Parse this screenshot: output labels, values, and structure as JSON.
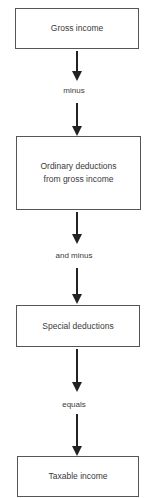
{
  "diagram": {
    "type": "flowchart",
    "direction": "top-to-bottom",
    "colors": {
      "background": "#ffffff",
      "box_border": "#555555",
      "arrow": "#222222",
      "text": "#3a3a3a"
    },
    "nodes": [
      {
        "id": "gross-income",
        "lines": [
          "Gross income"
        ]
      },
      {
        "id": "ordinary-deductions",
        "lines": [
          "Ordinary deductions",
          "from gross income"
        ]
      },
      {
        "id": "special-deductions",
        "lines": [
          "Special deductions"
        ]
      },
      {
        "id": "taxable-income",
        "lines": [
          "Taxable income"
        ]
      }
    ],
    "connectors": [
      {
        "from": "gross-income",
        "to": "ordinary-deductions",
        "label": "minus"
      },
      {
        "from": "ordinary-deductions",
        "to": "special-deductions",
        "label": "and minus"
      },
      {
        "from": "special-deductions",
        "to": "taxable-income",
        "label": "equals"
      }
    ]
  }
}
